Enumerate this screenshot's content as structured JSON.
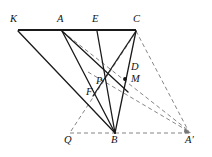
{
  "figure": {
    "background_color": "#ffffff",
    "stroke_color": "#1a1a1a",
    "dashed_color": "#777777",
    "points": {
      "K": {
        "label": "K",
        "x": 18,
        "y": 30,
        "label_x": 10,
        "label_y": 14
      },
      "A": {
        "label": "A",
        "x": 62,
        "y": 30,
        "label_x": 57,
        "label_y": 14
      },
      "E": {
        "label": "E",
        "x": 97,
        "y": 30,
        "label_x": 92,
        "label_y": 14
      },
      "C": {
        "label": "C",
        "x": 136,
        "y": 30,
        "label_x": 133,
        "label_y": 14
      },
      "D": {
        "label": "D",
        "x": 127,
        "y": 68,
        "label_x": 131,
        "label_y": 62
      },
      "M": {
        "label": "M",
        "x": 125,
        "y": 79,
        "label_x": 131,
        "label_y": 74
      },
      "P": {
        "label": "P",
        "x": 104,
        "y": 78,
        "label_x": 96,
        "label_y": 76
      },
      "F": {
        "label": "F",
        "x": 95,
        "y": 92,
        "label_x": 86,
        "label_y": 87
      },
      "Q": {
        "label": "Q",
        "x": 70,
        "y": 133,
        "label_x": 64,
        "label_y": 135
      },
      "B": {
        "label": "B",
        "x": 115,
        "y": 133,
        "label_x": 111,
        "label_y": 135
      },
      "Aprime": {
        "label": "A′",
        "x": 191,
        "y": 133,
        "label_x": 186,
        "label_y": 135
      }
    },
    "solid_segments": [
      {
        "name": "segment-K-C-top",
        "from": "K",
        "to": "C"
      },
      {
        "name": "segment-K-B",
        "from": "K",
        "to": "B"
      },
      {
        "name": "segment-A-B",
        "from": "A",
        "to": "B"
      },
      {
        "name": "segment-E-B",
        "from": "E",
        "to": "B"
      },
      {
        "name": "segment-C-B",
        "from": "C",
        "to": "B"
      },
      {
        "name": "segment-C-F",
        "from": "C",
        "to": "F"
      },
      {
        "name": "segment-A-M",
        "from": "A",
        "to": "M"
      }
    ],
    "dashed_segments": [
      {
        "name": "segment-Q-B-baseline",
        "from": "Q",
        "to": "B"
      },
      {
        "name": "segment-B-Aprime-baseline",
        "from": "B",
        "to": "Aprime"
      },
      {
        "name": "segment-C-Aprime",
        "from": "C",
        "to": "Aprime"
      },
      {
        "name": "segment-A-Aprime",
        "from": "A",
        "to": "Aprime"
      },
      {
        "name": "segment-Q-C",
        "from": "Q",
        "to": "C"
      },
      {
        "name": "segment-P-Aprime",
        "from": "P",
        "to": "Aprime"
      }
    ],
    "dots": [
      {
        "name": "dot-M",
        "at": "M"
      }
    ],
    "stroke_widths": {
      "solid": 1.3,
      "top_bar": 2.0,
      "dashed": 0.9
    }
  }
}
